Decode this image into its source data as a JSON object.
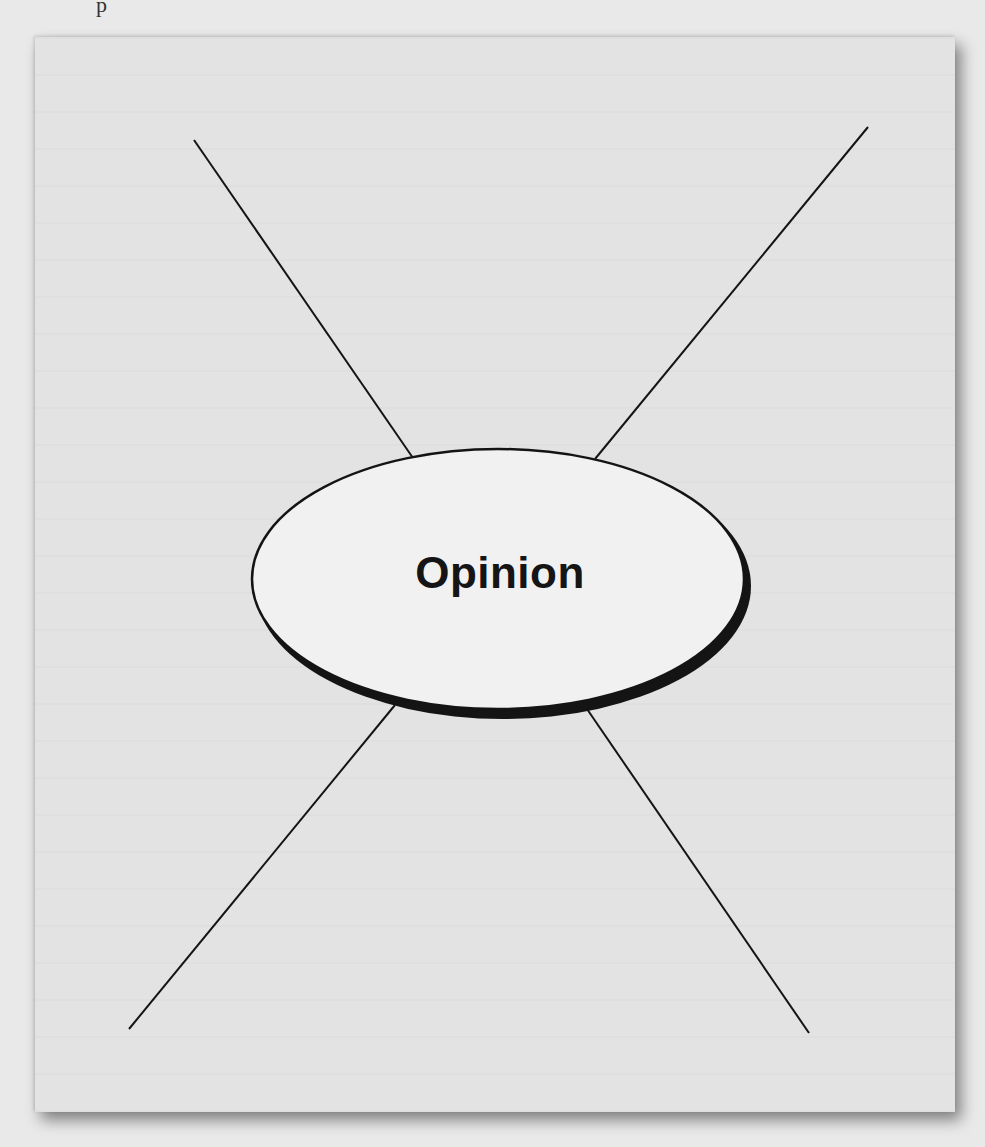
{
  "diagram": {
    "type": "web graphic organizer",
    "center_node": {
      "label": "Opinion"
    },
    "branches": [
      {
        "position": "top-left",
        "label": ""
      },
      {
        "position": "top-right",
        "label": ""
      },
      {
        "position": "bottom-left",
        "label": ""
      },
      {
        "position": "bottom-right",
        "label": ""
      }
    ],
    "colors": {
      "background": "#e9e9e9",
      "card": "#e3e3e3",
      "oval_fill": "#f1f1f1",
      "stroke": "#141414"
    }
  },
  "page_peek": {
    "glyph": "p"
  }
}
